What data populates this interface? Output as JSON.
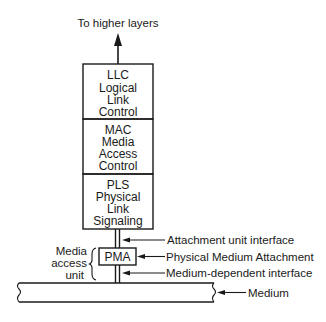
{
  "diagram": {
    "top_label": "To higher layers",
    "layers": [
      {
        "abbr": "LLC",
        "lines": [
          "Logical",
          "Link",
          "Control"
        ]
      },
      {
        "abbr": "MAC",
        "lines": [
          "Media",
          "Access",
          "Control"
        ]
      },
      {
        "abbr": "PLS",
        "lines": [
          "Physical",
          "Link",
          "Signaling"
        ]
      }
    ],
    "pma": {
      "label": "PMA"
    },
    "media_access_unit": {
      "lines": [
        "Media",
        "access",
        "unit"
      ]
    },
    "annotations": {
      "aui": "Attachment unit interface",
      "pma": "Physical Medium Attachment",
      "mdi": "Medium-dependent interface",
      "medium": "Medium"
    },
    "colors": {
      "ink": "#1a1a1a",
      "background": "#ffffff"
    }
  }
}
